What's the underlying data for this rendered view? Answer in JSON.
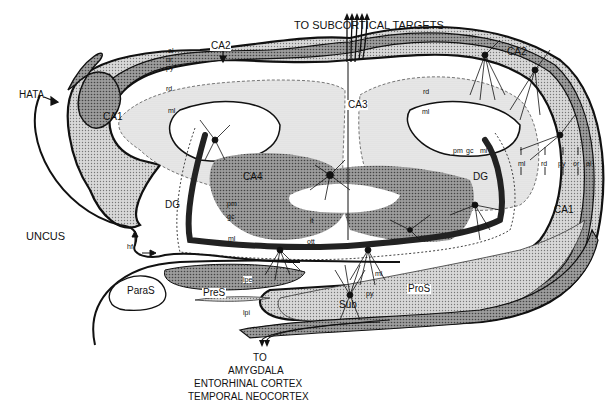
{
  "figure": {
    "title_top": "TO SUBCORTICAL TARGETS",
    "bottom_caption": {
      "line1": "TO",
      "line2": "AMYGDALA",
      "line3": "ENTORHINAL CORTEX",
      "line4": "TEMPORAL NEOCORTEX"
    }
  },
  "regions": {
    "hata": "HATA",
    "ca1_left": "CA1",
    "ca2": "CA2",
    "ca3": "CA3",
    "ca2_right": "CA2",
    "ca4": "CA4",
    "dg_left": "DG",
    "dg_right": "DG",
    "ca1_right": "CA1",
    "uncus": "UNCUS",
    "paras": "ParaS",
    "pres": "PreS",
    "pros": "ProS",
    "sub": "Sub"
  },
  "layers": {
    "al": "al",
    "or": "or",
    "py": "py",
    "rd": "rd",
    "ml": "ml",
    "pm": "pm",
    "gc": "gc",
    "it": "it",
    "ott": "ott",
    "hf": "hf",
    "lpe": "lpe",
    "lpi": "lpi",
    "rd_right": "rd",
    "ml_right": "ml",
    "ml_upper_right": "ml",
    "rd_upper_right": "rd",
    "py_right": "py",
    "or_right": "or",
    "al_right": "al",
    "pm_right": "pm",
    "gc_right": "gc",
    "ml_dg_right": "ml",
    "ml_dg_left": "ml",
    "ml_sub": "ml",
    "py_sub": "py"
  },
  "colors": {
    "ink": "#111111",
    "dark_fill": "#4a4a4a",
    "mid_fill": "#9a9a9a",
    "light_fill": "#cfcfcf",
    "pale_fill": "#e6e6e6",
    "paper": "#ffffff"
  }
}
